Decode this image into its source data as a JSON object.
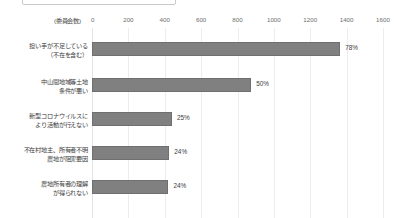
{
  "header": {
    "clipped_box_text": ""
  },
  "chart_data": {
    "type": "bar",
    "orientation": "horizontal",
    "title": "",
    "xlabel": "(委員会数)",
    "ylabel": "",
    "axis_unit_label": "(委員会数)",
    "xlim": [
      0,
      1600
    ],
    "xticks": [
      0,
      200,
      400,
      600,
      800,
      1000,
      1200,
      1400,
      1600
    ],
    "xtick_labels": [
      "0",
      "200",
      "400",
      "600",
      "800",
      "1000",
      "1200",
      "1400",
      "1600"
    ],
    "grid": true,
    "legend": null,
    "bar_color": "#808080",
    "categories": [
      "担い手が不足している\n（不在を含む）",
      "中山間地域等土地\n条件が悪い",
      "新型コロナウイルスに\nより活動が行えない",
      "不在村地主、所有者不明\n農地が阻害要因",
      "農地所有者の理解\nが得られない"
    ],
    "values": [
      1365,
      875,
      440,
      425,
      420
    ],
    "data_labels": [
      "78%",
      "50%",
      "25%",
      "24%",
      "24%"
    ]
  }
}
